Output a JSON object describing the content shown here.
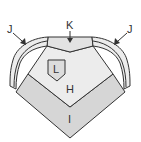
{
  "diagram": {
    "type": "parts-diagram",
    "labels": {
      "H": "H",
      "I": "I",
      "J_left": "J",
      "J_right": "J",
      "K": "K",
      "L": "L"
    },
    "colors": {
      "outline": "#333333",
      "panel_light": "#ececec",
      "panel_mid": "#d6d6d6",
      "background": "#ffffff"
    },
    "parts": [
      {
        "id": "H",
        "description": "central light panel"
      },
      {
        "id": "I",
        "description": "lower diamond panel"
      },
      {
        "id": "J",
        "description": "curved side bands (left and right)"
      },
      {
        "id": "K",
        "description": "top center piece"
      },
      {
        "id": "L",
        "description": "small badge/patch on panel H"
      }
    ]
  }
}
